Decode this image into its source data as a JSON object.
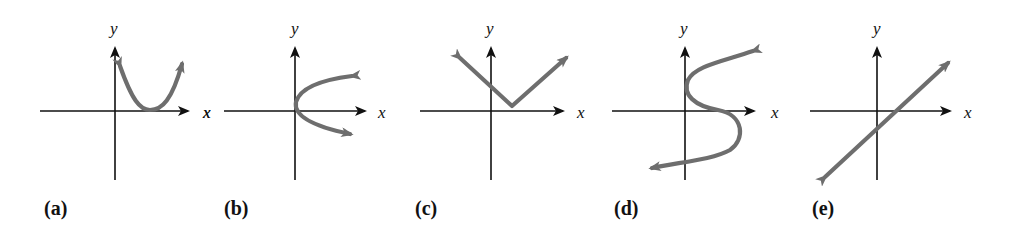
{
  "figure": {
    "panels": [
      {
        "id": "a",
        "label": "(a)",
        "x_axis_label": "x",
        "y_axis_label": "y",
        "curve": "parabola opening upward, vertex on positive x-axis",
        "curve_color": "#6e6e6e"
      },
      {
        "id": "b",
        "label": "(b)",
        "x_axis_label": "x",
        "x_axis_label_left": "x",
        "y_axis_label": "y",
        "curve": "parabola opening rightward, vertex at origin",
        "curve_color": "#6e6e6e"
      },
      {
        "id": "c",
        "label": "(c)",
        "x_axis_label": "x",
        "y_axis_label": "y",
        "curve": "V shape (absolute value), vertex above positive x-axis",
        "curve_color": "#6e6e6e"
      },
      {
        "id": "d",
        "label": "(d)",
        "x_axis_label": "x",
        "y_axis_label": "y",
        "curve": "S-shaped curve",
        "curve_color": "#6e6e6e"
      },
      {
        "id": "e",
        "label": "(e)",
        "x_axis_label": "x",
        "y_axis_label": "y",
        "curve": "straight line with positive slope",
        "curve_color": "#6e6e6e"
      }
    ]
  }
}
